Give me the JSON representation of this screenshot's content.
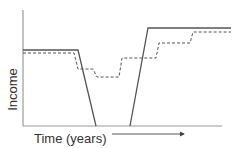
{
  "chart_data": {
    "type": "line",
    "title": "",
    "xlabel": "Time (years)",
    "ylabel": "Income",
    "grid": false,
    "legend": null,
    "annotations": [
      "arrow indicating direction of time →"
    ],
    "axis_ticks": "none",
    "series": [
      {
        "name": "solid",
        "style": "solid",
        "color": "#555555",
        "description": "Flat income, sharp drop to zero, period at zero, sharp rise to higher flat income",
        "points_px": [
          [
            23,
            50
          ],
          [
            78,
            50
          ],
          [
            96,
            126
          ],
          [
            130,
            126
          ],
          [
            148,
            28
          ],
          [
            231,
            28
          ]
        ]
      },
      {
        "name": "dashed",
        "style": "dashed",
        "color": "#555555",
        "description": "Slightly lower flat income, stepwise dip, then stepwise increases to a higher plateau",
        "points_px": [
          [
            23,
            53
          ],
          [
            74,
            53
          ],
          [
            78,
            69
          ],
          [
            93,
            69
          ],
          [
            97,
            77
          ],
          [
            119,
            77
          ],
          [
            122,
            58
          ],
          [
            156,
            58
          ],
          [
            159,
            43
          ],
          [
            190,
            43
          ],
          [
            193,
            32
          ],
          [
            231,
            32
          ]
        ]
      }
    ]
  },
  "labels": {
    "x_axis": "Time (years)",
    "y_axis": "Income"
  },
  "colors": {
    "axis": "#9a9a9a",
    "line": "#555555",
    "text": "#333333"
  }
}
